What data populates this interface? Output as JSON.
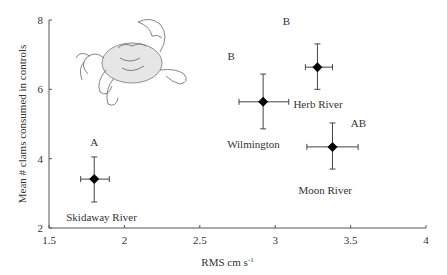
{
  "chart_data": {
    "type": "scatter",
    "title": "",
    "xlabel": "RMS cm s",
    "xlabel_superscript": "-1",
    "ylabel": "Mean # clams consumed in controls",
    "xlim": [
      1.5,
      4
    ],
    "ylim": [
      2,
      8
    ],
    "xticks": [
      "1.5",
      "2",
      "2.5",
      "3",
      "3.5",
      "4"
    ],
    "yticks": [
      "2",
      "4",
      "6",
      "8"
    ],
    "grid": false,
    "legend": null,
    "marker": "diamond",
    "error_bars": "both",
    "points": [
      {
        "name": "Skidaway River",
        "x": 1.8,
        "y": 3.41,
        "x_err_low": 1.71,
        "x_err_high": 1.9,
        "y_err_low": 2.75,
        "y_err_high": 4.05,
        "letter": "A"
      },
      {
        "name": "Wilmington",
        "x": 2.92,
        "y": 5.64,
        "x_err_low": 2.76,
        "x_err_high": 3.09,
        "y_err_low": 4.86,
        "y_err_high": 6.44,
        "letter": "B"
      },
      {
        "name": "Herb River",
        "x": 3.28,
        "y": 6.64,
        "x_err_low": 3.2,
        "x_err_high": 3.38,
        "y_err_low": 6.0,
        "y_err_high": 7.31,
        "letter": "B"
      },
      {
        "name": "Moon River",
        "x": 3.38,
        "y": 4.34,
        "x_err_low": 3.21,
        "x_err_high": 3.55,
        "y_err_low": 3.7,
        "y_err_high": 5.03,
        "letter": "AB"
      }
    ],
    "annotations": [
      "crab illustration (upper left)"
    ]
  }
}
